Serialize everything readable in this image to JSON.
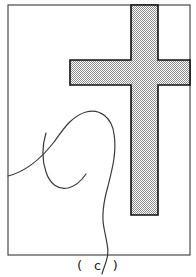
{
  "figure": {
    "caption": "( c )",
    "panel_label": "c",
    "kind": "line-drawing-with-shaded-overlay",
    "colors": {
      "background": "#ffffff",
      "frame_stroke": "#4a4a4a",
      "contour_stroke": "#3a3a3a",
      "shape_stroke": "#111111",
      "shape_fill_light": "#ffffff",
      "shape_fill_dark": "#8d8d8d",
      "caption_color": "#1a1a1a"
    },
    "frame": {
      "x": 8,
      "y": 5,
      "width": 182,
      "height": 250,
      "stroke_width": 1.2
    },
    "cross": {
      "name": "shaded-cross-region",
      "fill_pattern": "checkerboard-dither-50",
      "stroke_width": 1.6,
      "vertical_bar": {
        "x": 131,
        "y": 5,
        "width": 27,
        "height": 210
      },
      "horizontal_bar": {
        "x": 70,
        "y": 60,
        "width": 120,
        "height": 25
      },
      "outline_points": "131,5 158,5 158,60 190,60 190,85 158,85 158,215 131,215 131,85 70,85 70,60 131,60"
    },
    "contour": {
      "name": "anatomical-contour",
      "stroke_width": 1.2,
      "outer_path": "M 8,176 C 24,172 40,160 54,142 C 64,128 72,116 86,112 C 100,108 112,118 114,134 C 117,152 112,170 108,186 C 104,200 101,214 104,228 C 107,244 110,252 106,262 C 104,268 103,270 102,274",
      "inner_path": "M 46,133 C 42,146 42,160 46,172 C 50,184 58,190 68,188 C 76,186 82,180 86,174"
    },
    "caption_position": {
      "x": 98,
      "y": 270
    }
  }
}
